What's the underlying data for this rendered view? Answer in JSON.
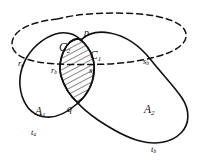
{
  "figure": {
    "type": "topological-diagram",
    "background_color": "#ffffff",
    "stroke_color": "#111111",
    "hatch_color": "#111111",
    "labels": {
      "p": "p",
      "q": "q",
      "C1_main": "C",
      "C1_sub": "1",
      "C2_main": "C",
      "C2_sub": "2",
      "A1_main": "A",
      "A1_sub": "1",
      "A2_main": "A",
      "A2_sub": "2",
      "ra_main": "r",
      "ra_sub": "a",
      "rb_main": "r",
      "rb_sub": "b",
      "sa_main": "s",
      "sa_sub": "a",
      "sb_main": "s",
      "sb_sub": "b",
      "ta_main": "t",
      "ta_sub": "a",
      "tb_main": "t",
      "tb_sub": "b"
    }
  }
}
